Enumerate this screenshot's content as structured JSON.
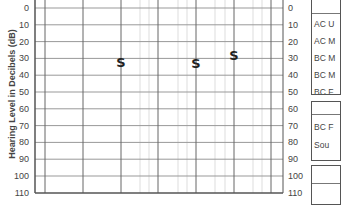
{
  "chart_data": {
    "type": "scatter",
    "title": "",
    "subtitle": "",
    "xlabel": "",
    "ylabel": "Hearing Level in Decibels (dB)",
    "ylim": [
      0,
      110
    ],
    "y_inverted": true,
    "y_ticks_left": [
      "0",
      "10",
      "20",
      "30",
      "40",
      "50",
      "60",
      "70",
      "80",
      "90",
      "100",
      "110"
    ],
    "y_ticks_right": [
      "0",
      "10",
      "20",
      "30",
      "40",
      "50",
      "60",
      "70",
      "80",
      "90",
      "100",
      "110"
    ],
    "grid": true,
    "x_octave_lines": 7,
    "series": [
      {
        "name": "Sound field",
        "symbol": "S",
        "points": [
          {
            "x_index": 2,
            "db": 32
          },
          {
            "x_index": 4,
            "db": 33
          },
          {
            "x_index": 5,
            "db": 28
          }
        ]
      }
    ],
    "legend_position": "right"
  },
  "legend": {
    "box1": {
      "items": [
        "AC U",
        "AC M",
        "BC M",
        "BC M",
        "BC F"
      ]
    },
    "box2": {
      "items": [
        "BC F",
        "Sou"
      ]
    },
    "box3": {
      "items": []
    }
  },
  "colors": {
    "grid_major": "#666666",
    "grid_minor": "#dddddd",
    "symbol": "#222222",
    "text": "#444444"
  }
}
